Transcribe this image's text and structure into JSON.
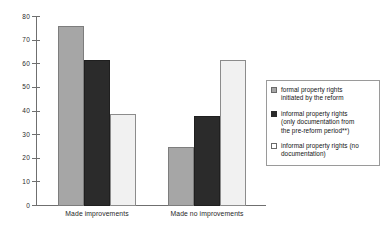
{
  "chart_data": {
    "type": "bar",
    "title": "",
    "subtitle": "",
    "xlabel": "",
    "ylabel": "",
    "ylim": [
      0,
      80
    ],
    "ytick_step": 10,
    "yticks": [
      0,
      10,
      20,
      30,
      40,
      50,
      60,
      70,
      80
    ],
    "grid": false,
    "legend_position": "right",
    "categories": [
      "Made improvements",
      "Made no improvements"
    ],
    "series": [
      {
        "name": "formal property rights initiated by the reform",
        "color": "#a6a6a6",
        "values": [
          76,
          25
        ]
      },
      {
        "name": "informal property rights (only documentation from the pre-reform period**)",
        "color": "#2b2b2b",
        "values": [
          62,
          38
        ]
      },
      {
        "name": "informal property rights (no documentation)",
        "color": "#f1f1f1",
        "values": [
          39,
          62
        ]
      }
    ],
    "annotations": []
  },
  "axis": {
    "y_tick_labels": [
      "80",
      "70",
      "60",
      "50",
      "40",
      "30",
      "20",
      "10",
      "0"
    ],
    "x_tick_labels": [
      "Made improvements",
      "Made no improvements"
    ]
  },
  "legend": {
    "items": [
      {
        "swatch": "gray-swatch",
        "line1": "formal property rights",
        "line2": "initiated by the reform",
        "line3": ""
      },
      {
        "swatch": "black-swatch",
        "line1": "informal property rights",
        "line2": "(only documentation from",
        "line3": "the pre-reform period**)"
      },
      {
        "swatch": "white-swatch",
        "line1": "informal property rights (no",
        "line2": "documentation)",
        "line3": ""
      }
    ]
  },
  "colors": {
    "series_1": "#a6a6a6",
    "series_2": "#2b2b2b",
    "series_3": "#f1f1f1",
    "axis": "#6f6f6f",
    "background": "#ffffff"
  }
}
